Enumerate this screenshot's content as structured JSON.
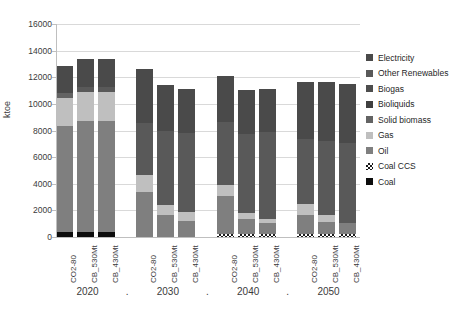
{
  "chart_data": {
    "type": "bar",
    "stacked": true,
    "title": "",
    "xlabel": "",
    "ylabel": "ktoe",
    "ylim": [
      0,
      16000
    ],
    "yticks": [
      0,
      2000,
      4000,
      6000,
      8000,
      10000,
      12000,
      14000,
      16000
    ],
    "grid": true,
    "legend_position": "right",
    "groups": [
      "2020",
      "2030",
      "2040",
      "2050"
    ],
    "group_separator": ".",
    "scenarios": [
      "CO2-80",
      "CB_530Mt",
      "CB_430Mt"
    ],
    "categories": [
      "2020 CO2-80",
      "2020 CB_530Mt",
      "2020 CB_430Mt",
      "2030 CO2-80",
      "2030 CB_530Mt",
      "2030 CB_430Mt",
      "2040 CO2-80",
      "2040 CB_530Mt",
      "2040 CB_430Mt",
      "2050 CO2-80",
      "2050 CB_530Mt",
      "2050 CB_430Mt"
    ],
    "series": [
      {
        "name": "Coal",
        "color": "#0d0d0d",
        "values": [
          380,
          380,
          380,
          0,
          0,
          0,
          0,
          0,
          0,
          0,
          0,
          0
        ]
      },
      {
        "name": "Coal CCS",
        "color": "#1a1a1a",
        "hatched": true,
        "values": [
          0,
          0,
          0,
          0,
          0,
          0,
          260,
          260,
          260,
          260,
          260,
          260
        ]
      },
      {
        "name": "Oil",
        "color": "#7f7f7f",
        "values": [
          7930,
          8320,
          8320,
          3350,
          1680,
          1200,
          2840,
          1100,
          830,
          1360,
          860,
          760
        ]
      },
      {
        "name": "Gas",
        "color": "#bfbfbf",
        "values": [
          2130,
          2160,
          2160,
          1330,
          760,
          670,
          810,
          440,
          280,
          850,
          520,
          0
        ]
      },
      {
        "name": "Solid biomass",
        "color": "#636363",
        "values": [
          380,
          0,
          0,
          0,
          0,
          0,
          0,
          0,
          0,
          0,
          0,
          0
        ]
      },
      {
        "name": "Bioliquids",
        "color": "#3f3f3f",
        "values": [
          0,
          0,
          0,
          0,
          0,
          0,
          0,
          0,
          0,
          0,
          0,
          0
        ]
      },
      {
        "name": "Biogas",
        "color": "#4d4d4d",
        "values": [
          0,
          0,
          0,
          0,
          0,
          0,
          0,
          0,
          0,
          0,
          0,
          0
        ]
      },
      {
        "name": "Other Renewables",
        "color": "#595959",
        "values": [
          0,
          400,
          400,
          3880,
          5550,
          5960,
          4740,
          5930,
          6510,
          4930,
          5590,
          6010
        ]
      },
      {
        "name": "Electricity",
        "color": "#4a4a4a",
        "values": [
          2000,
          2080,
          2080,
          4060,
          3450,
          3310,
          3440,
          3350,
          3270,
          4250,
          4420,
          4450
        ]
      }
    ],
    "totals": [
      12820,
      13340,
      13340,
      12620,
      11440,
      11140,
      12090,
      11080,
      11150,
      11650,
      11650,
      11480
    ]
  },
  "legend": {
    "items": [
      {
        "label": "Electricity",
        "color": "#4a4a4a",
        "hatched": false
      },
      {
        "label": "Other Renewables",
        "color": "#595959",
        "hatched": false
      },
      {
        "label": "Biogas",
        "color": "#4d4d4d",
        "hatched": false
      },
      {
        "label": "Bioliquids",
        "color": "#3f3f3f",
        "hatched": false
      },
      {
        "label": "Solid biomass",
        "color": "#636363",
        "hatched": false
      },
      {
        "label": "Gas",
        "color": "#bfbfbf",
        "hatched": false
      },
      {
        "label": "Oil",
        "color": "#7f7f7f",
        "hatched": false
      },
      {
        "label": "Coal CCS",
        "color": "#1a1a1a",
        "hatched": true
      },
      {
        "label": "Coal",
        "color": "#0d0d0d",
        "hatched": false
      }
    ]
  }
}
